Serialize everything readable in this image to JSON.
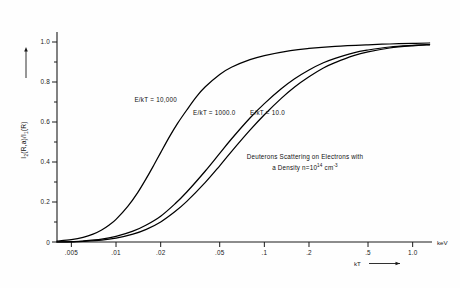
{
  "chart_data": {
    "type": "line",
    "title": "",
    "subtitle": "",
    "xlabel": "kT",
    "xunit": "keV",
    "ylabel": "I2(R,a)/I1(R)",
    "xscale": "log",
    "yscale": "linear",
    "xlim": [
      0.004,
      1.35
    ],
    "ylim": [
      0,
      1.05
    ],
    "grid": false,
    "legend": "inline-annotations",
    "xticks": [
      {
        "value": 0.005,
        "label": ".005"
      },
      {
        "value": 0.01,
        "label": ".01"
      },
      {
        "value": 0.02,
        "label": ".02"
      },
      {
        "value": 0.05,
        "label": ".05"
      },
      {
        "value": 0.1,
        "label": ".1"
      },
      {
        "value": 0.2,
        "label": ".2"
      },
      {
        "value": 0.5,
        "label": ".5"
      },
      {
        "value": 1.0,
        "label": "1.0"
      }
    ],
    "yticks": [
      {
        "value": 0.0,
        "label": "0"
      },
      {
        "value": 0.1,
        "label": ""
      },
      {
        "value": 0.2,
        "label": "0.2"
      },
      {
        "value": 0.3,
        "label": ""
      },
      {
        "value": 0.4,
        "label": "0.4"
      },
      {
        "value": 0.5,
        "label": ""
      },
      {
        "value": 0.6,
        "label": "0.6"
      },
      {
        "value": 0.7,
        "label": ""
      },
      {
        "value": 0.8,
        "label": "0.8"
      },
      {
        "value": 0.9,
        "label": ""
      },
      {
        "value": 1.0,
        "label": "1.0"
      }
    ],
    "series": [
      {
        "name": "E/kT = 10,000",
        "label": "E/kT = 10,000",
        "color": "#000000",
        "x": [
          0.004,
          0.005,
          0.006,
          0.007,
          0.008,
          0.009,
          0.01,
          0.012,
          0.014,
          0.016,
          0.018,
          0.02,
          0.023,
          0.026,
          0.03,
          0.035,
          0.04,
          0.05,
          0.06,
          0.08,
          0.1,
          0.15,
          0.2,
          0.3,
          0.5,
          0.7,
          1.0,
          1.3
        ],
        "y": [
          0.005,
          0.012,
          0.023,
          0.039,
          0.06,
          0.085,
          0.113,
          0.178,
          0.247,
          0.318,
          0.385,
          0.447,
          0.528,
          0.593,
          0.66,
          0.728,
          0.776,
          0.838,
          0.874,
          0.912,
          0.932,
          0.957,
          0.968,
          0.978,
          0.986,
          0.99,
          0.993,
          0.995
        ]
      },
      {
        "name": "E/kT = 1000.0",
        "label": "E/kT = 1000.0",
        "color": "#000000",
        "x": [
          0.004,
          0.005,
          0.006,
          0.008,
          0.01,
          0.013,
          0.016,
          0.02,
          0.025,
          0.03,
          0.04,
          0.05,
          0.06,
          0.08,
          0.1,
          0.13,
          0.16,
          0.2,
          0.25,
          0.3,
          0.4,
          0.5,
          0.7,
          1.0,
          1.3
        ],
        "y": [
          0.0,
          0.002,
          0.005,
          0.014,
          0.028,
          0.054,
          0.085,
          0.129,
          0.191,
          0.25,
          0.355,
          0.443,
          0.515,
          0.62,
          0.692,
          0.766,
          0.816,
          0.86,
          0.896,
          0.918,
          0.946,
          0.96,
          0.975,
          0.983,
          0.987
        ]
      },
      {
        "name": "E/kT = 10.0",
        "label": "E/kT = 10.0",
        "color": "#000000",
        "x": [
          0.004,
          0.005,
          0.006,
          0.008,
          0.01,
          0.013,
          0.016,
          0.02,
          0.025,
          0.03,
          0.04,
          0.05,
          0.06,
          0.08,
          0.1,
          0.13,
          0.16,
          0.2,
          0.25,
          0.3,
          0.4,
          0.5,
          0.7,
          1.0,
          1.3
        ],
        "y": [
          0.0,
          0.001,
          0.003,
          0.009,
          0.019,
          0.039,
          0.063,
          0.1,
          0.152,
          0.203,
          0.298,
          0.381,
          0.452,
          0.559,
          0.636,
          0.718,
          0.775,
          0.826,
          0.87,
          0.897,
          0.932,
          0.951,
          0.97,
          0.981,
          0.986
        ]
      }
    ],
    "annotations": [
      {
        "name": "curve-label-10000",
        "text": "E/kT = 10,000",
        "x": 0.0185,
        "y": 0.7
      },
      {
        "name": "curve-label-1000",
        "text": "E/kT = 1000.0",
        "x": 0.046,
        "y": 0.635
      },
      {
        "name": "curve-label-10",
        "text": "E/kT = 10.0",
        "x": 0.105,
        "y": 0.635
      },
      {
        "name": "caption-line-1",
        "text": "Deuterons Scattering on Electrons with",
        "x": 0.1,
        "y": 0.38
      },
      {
        "name": "caption-line-2",
        "text": "a Density n=10",
        "x": 0.1,
        "y": 0.3
      }
    ]
  },
  "axes": {
    "y_label_main": "I",
    "y_label_sub1": "2",
    "y_label_mid": "(R,a)/I",
    "y_label_sub2": "1",
    "y_label_end": "(R)",
    "x_label": "kT",
    "x_unit": "keV",
    "origin_label": "0"
  },
  "caption": {
    "line1": "Deuterons Scattering on Electrons with",
    "line2_a": "a Density n=10",
    "line2_exp": "14",
    "line2_b": " cm",
    "line2_exp2": "-3"
  },
  "curve_labels": {
    "c1": "E/kT = 10,000",
    "c2": "E/kT = 1000.0",
    "c3": "E/kT = 10.0"
  },
  "tick_labels": {
    "y": [
      "1.0",
      "0.8",
      "0.6",
      "0.4",
      "0.2",
      "0"
    ],
    "x": [
      ".005",
      ".01",
      ".02",
      ".05",
      ".1",
      ".2",
      ".5",
      "1.0"
    ]
  }
}
